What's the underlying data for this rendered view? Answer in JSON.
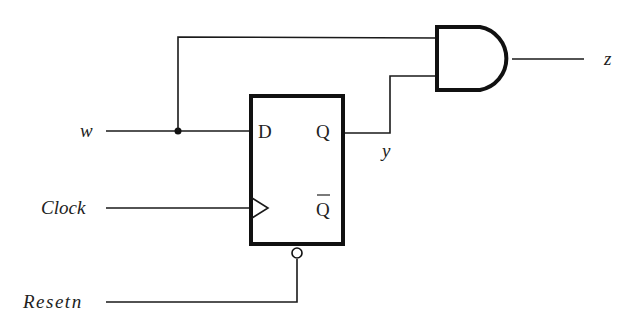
{
  "diagram": {
    "type": "sequential-circuit",
    "components": {
      "flip_flop": {
        "kind": "D flip-flop",
        "pins": {
          "d": "D",
          "q": "Q",
          "qbar": "Q",
          "clock": "clock-triangle",
          "reset": "active-low reset (bubble)"
        }
      },
      "gate": {
        "kind": "AND"
      }
    },
    "signals": {
      "w": "w",
      "clock": "Clock",
      "resetn": "Resetn",
      "y": "y",
      "z": "z"
    },
    "colors": {
      "line": "#1a1a1a",
      "background": "#ffffff"
    }
  }
}
